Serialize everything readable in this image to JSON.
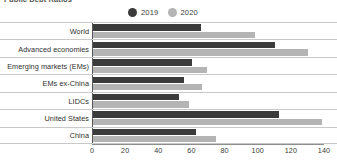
{
  "chart_title": "Public Debt Ratios",
  "legend": {
    "position": "top-center",
    "entries": [
      {
        "label": "2019",
        "color": "#3b3b3b",
        "marker": "circle"
      },
      {
        "label": "2020",
        "color": "#b4b4b4",
        "marker": "circle"
      }
    ]
  },
  "chart_data": {
    "type": "bar",
    "orientation": "horizontal",
    "title": "Public Debt Ratios",
    "xlabel": "",
    "ylabel": "",
    "xlim": [
      0,
      140
    ],
    "xticks": [
      0,
      20,
      40,
      60,
      80,
      100,
      120,
      140
    ],
    "grid": false,
    "legend_position": "top-center",
    "categories": [
      "World",
      "Advanced economies",
      "Emerging markets (EMs)",
      "EMs ex-China",
      "LIDCs",
      "United States",
      "China"
    ],
    "series": [
      {
        "name": "2019",
        "color": "#3b3b3b",
        "values": [
          65,
          110,
          60,
          55,
          52,
          112,
          62
        ]
      },
      {
        "name": "2020",
        "color": "#b4b4b4",
        "values": [
          98,
          130,
          69,
          66,
          58,
          138,
          74
        ]
      }
    ]
  },
  "axis": {
    "x_tick_labels": [
      "0",
      "20",
      "40",
      "60",
      "80",
      "100",
      "120",
      "140"
    ]
  },
  "colors": {
    "series_2019": "#3b3b3b",
    "series_2020": "#b4b4b4",
    "axis": "#5a5a5a",
    "gridline": "#c9c9c9",
    "text": "#2f2f2f",
    "background": "#ffffff"
  }
}
